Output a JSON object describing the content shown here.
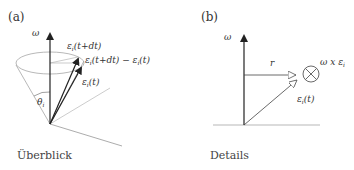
{
  "panels": [
    {
      "id": "a",
      "label": "(a)",
      "caption": "Überblick",
      "labels": {
        "omega": "ω",
        "eps_next": "ε",
        "eps_next_sub": "i",
        "eps_next_arg": "(t+dt)",
        "diff_a": "ε",
        "diff_a_sub": "i",
        "diff_a_arg": "(t+dt) − ε",
        "diff_b_sub": "i",
        "diff_b_arg": "(t)",
        "eps_now": "ε",
        "eps_now_sub": "i",
        "eps_now_arg": "(t)",
        "theta": "θ",
        "theta_sub": "i"
      }
    },
    {
      "id": "b",
      "label": "(b)",
      "caption": "Details",
      "labels": {
        "omega": "ω",
        "r": "r",
        "cross": "ω x ε",
        "cross_sub": "i",
        "eps_now": "ε",
        "eps_now_sub": "i",
        "eps_now_arg": "(t)"
      }
    }
  ]
}
